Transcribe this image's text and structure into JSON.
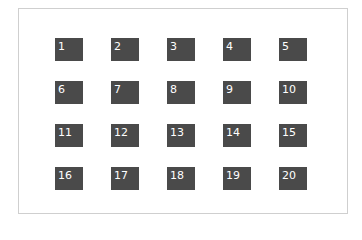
{
  "colors": {
    "cell_bg": "#4a4a4a",
    "cell_text": "#ffffff",
    "frame_border": "#cfcfcf"
  },
  "grid": {
    "rows": 4,
    "cols": 5,
    "cells": [
      "1",
      "2",
      "3",
      "4",
      "5",
      "6",
      "7",
      "8",
      "9",
      "10",
      "11",
      "12",
      "13",
      "14",
      "15",
      "16",
      "17",
      "18",
      "19",
      "20"
    ]
  }
}
